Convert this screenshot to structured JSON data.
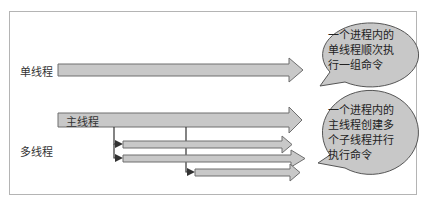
{
  "diagram": {
    "colors": {
      "frame": "#b4b4b4",
      "arrow_fill": "#c8c8c8",
      "arrow_stroke": "#6e6e6e",
      "bubble_fill": "#c8c8c8",
      "bubble_stroke": "#555555",
      "connector": "#333333"
    },
    "single_thread": {
      "row_label": "单线程",
      "bubble_lines": [
        "一个进程内的",
        "单线程顺次执",
        "行一组命令"
      ]
    },
    "multi_thread": {
      "row_label": "多线程",
      "main_arrow_label": "主线程",
      "child_arrow_count": 3,
      "bubble_lines": [
        "一个进程内的",
        "主线程创建多",
        "个子线程并行",
        "执行命令"
      ]
    }
  }
}
